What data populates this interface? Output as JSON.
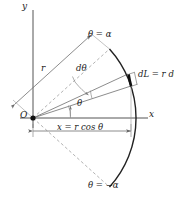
{
  "figure": {
    "kind": "geometry-diagram",
    "colors": {
      "background": "#ffffff",
      "line": "#333333",
      "thin_line": "#777777",
      "dashed_line": "#999999",
      "arc": "#222222",
      "arc_element": "#111111",
      "text": "#1a1a1a",
      "axis": "#555555"
    },
    "labels": {
      "y_axis": "y",
      "x_axis": "x",
      "origin": "O",
      "radius": "r",
      "theta_upper": "θ = α",
      "theta_lower": "θ = −α",
      "theta": "θ",
      "d_theta": "dθ",
      "arc_element": "dL = r dθ",
      "x_projection": "x = r cos θ"
    },
    "geometry": {
      "origin": [
        33,
        118
      ],
      "radius_px": 103,
      "alpha_deg": 42,
      "theta_deg": 18,
      "d_theta_deg": 7,
      "arc_start_deg": 42,
      "arc_end_deg": -42,
      "x_projection_end": 131,
      "y_axis_top": 10,
      "x_axis_right": 148
    }
  }
}
